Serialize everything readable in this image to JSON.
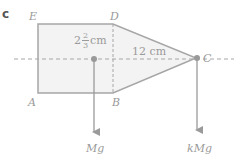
{
  "figure": {
    "part_label": "c",
    "vertices": {
      "E": "E",
      "D": "D",
      "A": "A",
      "B": "B",
      "C": "C"
    },
    "dimensions": {
      "left_whole": "2",
      "left_num": "2",
      "left_den": "3",
      "left_unit": "cm",
      "right": "12 cm"
    },
    "forces": {
      "left": "Mg",
      "right": "kMg"
    },
    "colors": {
      "fill": "#f2f2f2",
      "stroke": "#a6a6a6",
      "text": "#9a9a9a"
    }
  }
}
